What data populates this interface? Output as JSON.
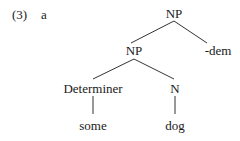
{
  "example": {
    "number": "(3)",
    "letter": "a"
  },
  "tree": {
    "root": {
      "label": "NP",
      "x": 174,
      "y": 14
    },
    "np_inner": {
      "label": "NP",
      "x": 134,
      "y": 51
    },
    "dem": {
      "label": "-dem",
      "x": 218,
      "y": 51
    },
    "determiner": {
      "label": "Determiner",
      "x": 93,
      "y": 89
    },
    "noun": {
      "label": "N",
      "x": 175,
      "y": 89
    },
    "some": {
      "label": "some",
      "x": 93,
      "y": 126
    },
    "dog": {
      "label": "dog",
      "x": 175,
      "y": 126
    }
  },
  "edges": [
    [
      "root",
      "np_inner"
    ],
    [
      "root",
      "dem"
    ],
    [
      "np_inner",
      "determiner"
    ],
    [
      "np_inner",
      "noun"
    ],
    [
      "determiner",
      "some"
    ],
    [
      "noun",
      "dog"
    ]
  ]
}
